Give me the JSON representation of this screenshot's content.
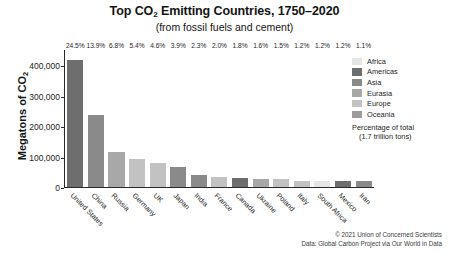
{
  "chart_data": {
    "type": "bar",
    "title": "Top CO2 Emitting Countries, 1750–2020",
    "title_prefix": "Top CO",
    "title_sub": "2",
    "title_suffix": " Emitting Countries, 1750–2020",
    "subtitle": "(from fossil fuels and cement)",
    "xlabel": "",
    "ylabel": "Megatons of CO2",
    "ylabel_prefix": "Megatons of CO",
    "ylabel_sub": "2",
    "ylim": [
      0,
      450000
    ],
    "yticks": [
      0,
      100000,
      200000,
      300000,
      400000
    ],
    "ytick_labels": [
      "0",
      "100,000",
      "200,000",
      "300,000",
      "400,000"
    ],
    "grid": false,
    "legend_position": "right",
    "categories": [
      "United States",
      "China",
      "Russia",
      "Germany",
      "UK",
      "Japan",
      "India",
      "France",
      "Canada",
      "Ukraine",
      "Poland",
      "Italy",
      "South Africa",
      "Mexico",
      "Iran"
    ],
    "values": [
      416500,
      236300,
      115600,
      91800,
      78200,
      66300,
      39100,
      34000,
      30600,
      27200,
      25500,
      20400,
      20400,
      20400,
      18700
    ],
    "data_labels": [
      "24.5%",
      "13.9%",
      "6.8%",
      "5.4%",
      "4.6%",
      "3.9%",
      "2.3%",
      "2.0%",
      "1.8%",
      "1.6%",
      "1.5%",
      "1.2%",
      "1.2%",
      "1.2%",
      "1.1%"
    ],
    "percentages": [
      24.5,
      13.9,
      6.8,
      5.4,
      4.6,
      3.9,
      2.3,
      2.0,
      1.8,
      1.6,
      1.5,
      1.2,
      1.2,
      1.2,
      1.1
    ],
    "regions": [
      "Americas",
      "Asia",
      "Eurasia",
      "Europe",
      "Europe",
      "Asia",
      "Asia",
      "Europe",
      "Americas",
      "Eurasia",
      "Europe",
      "Europe",
      "Africa",
      "Americas",
      "Asia"
    ],
    "bar_colors": [
      "#6e6e6e",
      "#8a8a8a",
      "#a8a8a8",
      "#c2c2c2",
      "#c2c2c2",
      "#8a8a8a",
      "#8a8a8a",
      "#c2c2c2",
      "#6e6e6e",
      "#a8a8a8",
      "#c2c2c2",
      "#c2c2c2",
      "#e6e6e6",
      "#6e6e6e",
      "#8a8a8a"
    ],
    "legend": [
      {
        "label": "Africa",
        "color": "#e6e6e6"
      },
      {
        "label": "Americas",
        "color": "#6e6e6e"
      },
      {
        "label": "Asia",
        "color": "#8a8a8a"
      },
      {
        "label": "Eurasia",
        "color": "#a8a8a8"
      },
      {
        "label": "Europe",
        "color": "#c2c2c2"
      },
      {
        "label": "Oceania",
        "color": "#9b9b9b"
      }
    ],
    "legend_note_line1": "Percentage of total",
    "legend_note_line2": "(1.7 trillion tons)",
    "footer_line1": "© 2021 Union of Concerned Scientists",
    "footer_line2": "Data: Global Carbon Project via Our World in Data"
  }
}
